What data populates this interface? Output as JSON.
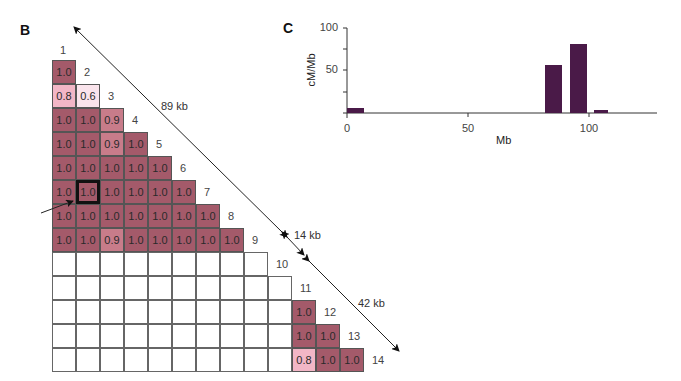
{
  "panels": {
    "b_label": "B",
    "c_label": "C"
  },
  "ld_matrix": {
    "marker_labels": [
      "1",
      "2",
      "3",
      "4",
      "5",
      "6",
      "7",
      "8",
      "9",
      "10",
      "11",
      "12",
      "13",
      "14"
    ],
    "rows": [
      [
        "1.0"
      ],
      [
        "0.8",
        "0.6"
      ],
      [
        "1.0",
        "1.0",
        "0.9"
      ],
      [
        "1.0",
        "1.0",
        "0.9",
        "1.0"
      ],
      [
        "1.0",
        "1.0",
        "1.0",
        "1.0",
        "1.0"
      ],
      [
        "1.0",
        "1.0",
        "1.0",
        "1.0",
        "1.0",
        "1.0"
      ],
      [
        "1.0",
        "1.0",
        "1.0",
        "1.0",
        "1.0",
        "1.0",
        "1.0"
      ],
      [
        "1.0",
        "1.0",
        "0.9",
        "1.0",
        "1.0",
        "1.0",
        "1.0",
        "1.0"
      ],
      [
        "",
        "",
        "",
        "",
        "",
        "",
        "",
        "",
        ""
      ],
      [
        "",
        "",
        "",
        "",
        "",
        "",
        "",
        "",
        "",
        ""
      ],
      [
        "",
        "",
        "",
        "",
        "",
        "",
        "",
        "",
        "",
        "",
        "1.0"
      ],
      [
        "",
        "",
        "",
        "",
        "",
        "",
        "",
        "",
        "",
        "",
        "1.0",
        "1.0"
      ],
      [
        "",
        "",
        "",
        "",
        "",
        "",
        "",
        "",
        "",
        "",
        "0.8",
        "1.0",
        "1.0"
      ]
    ],
    "highlighted_cell": {
      "row": 5,
      "col": 1
    },
    "colors": {
      "1.0": "#a45a6a",
      "0.9": "#c87c8a",
      "0.8": "#f2b6c6",
      "0.6": "#fae4ec"
    },
    "distances": {
      "block1": "89 kb",
      "gap": "14 kb",
      "block2": "42 kb"
    }
  },
  "chart_data": {
    "type": "bar",
    "title": "",
    "xlabel": "Mb",
    "ylabel": "cM/Mb",
    "xlim": [
      0,
      128
    ],
    "ylim": [
      0,
      100
    ],
    "xticks": [
      "0",
      "50",
      "100"
    ],
    "yticks": [
      "50",
      "100"
    ],
    "grid": false,
    "bars": [
      {
        "x_start": 0,
        "x_end": 7,
        "value": 6
      },
      {
        "x_start": 82,
        "x_end": 89,
        "value": 57
      },
      {
        "x_start": 92,
        "x_end": 99,
        "value": 81
      },
      {
        "x_start": 102,
        "x_end": 108,
        "value": 4
      }
    ],
    "bar_color": "#4a1a48"
  }
}
